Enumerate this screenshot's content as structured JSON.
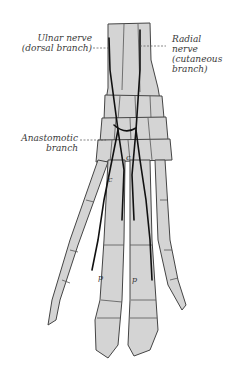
{
  "figure": {
    "colors": {
      "bone_fill": "#d4d4d4",
      "outline": "#444444",
      "nerve": "#111111",
      "background": "#ffffff"
    }
  },
  "labels": {
    "ulnar": {
      "line1": "Ulnar nerve",
      "line2": "(dorsal branch)"
    },
    "radial": {
      "line1": "Radial",
      "line2": "nerve",
      "line3": "(cutaneous",
      "line4": "branch)"
    },
    "anastomotic": {
      "line1": "Anastomotic",
      "line2": "branch"
    }
  },
  "bone_letters": {
    "c1": "c",
    "c2": "c",
    "p1": "p",
    "p2": "p"
  }
}
